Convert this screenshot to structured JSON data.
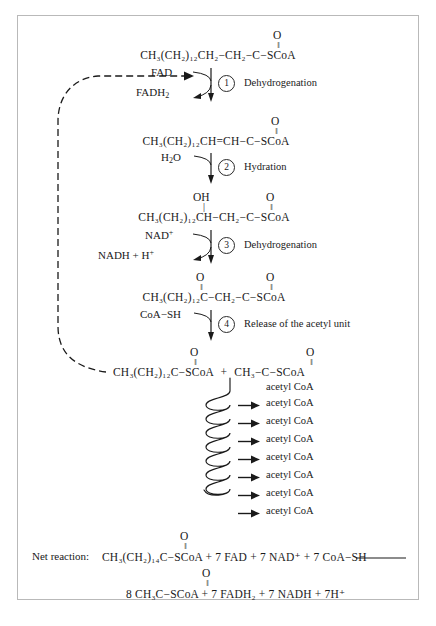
{
  "figure": {
    "ink_color": "#1a1a1a",
    "frame_color": "#b9b9b9",
    "background": "#ffffff"
  },
  "substrates": {
    "s1": {
      "carbonyl": "O",
      "chain": "CH₃(CH₂)₁₂CH₂−CH₂−C−SCoA",
      "label": "acyl CoA"
    },
    "s2": {
      "carbonyl": "O",
      "chain": "CH₃(CH₂)₁₂CH=CH−C−SCoA",
      "label": "trans-enoyl CoA"
    },
    "s3": {
      "hydroxyl": "OH",
      "carbonyl": "O",
      "chain": "CH₃(CH₂)₁₂CH−CH₂−C−SCoA",
      "label": "3-hydroxyacyl CoA"
    },
    "s4": {
      "carbonyl_a": "O",
      "carbonyl_b": "O",
      "chain": "CH₃(CH₂)₁₂C−CH₂−C−SCoA",
      "label": "3-ketoacyl CoA"
    },
    "s5": {
      "carbonyl_a": "O",
      "carbonyl_b": "O",
      "chain_left": "CH₃(CH₂)₁₂C−SCoA",
      "plus": "+",
      "chain_right": "CH₃−C−SCoA",
      "label": "shortened acyl CoA plus acetyl CoA"
    }
  },
  "steps": [
    {
      "number": "1",
      "name": "Dehydrogenation",
      "reactant": "FAD",
      "product": "FADH",
      "product_sub": "2"
    },
    {
      "number": "2",
      "name": "Hydration",
      "reactant": "H",
      "reactant_sub": "2",
      "reactant_tail": "O",
      "product": ""
    },
    {
      "number": "3",
      "name": "Dehydrogenation",
      "reactant": "NAD",
      "reactant_sup": "+",
      "product": "NADH  +  H",
      "product_sup": "+"
    },
    {
      "number": "4",
      "name": "Release of the acetyl unit",
      "reactant": "CoA−SH",
      "product": ""
    }
  ],
  "spiral": {
    "note": "coil of repeated beta-oxidation cycles",
    "loop_count": 7,
    "outputs": [
      "acetyl CoA",
      "acetyl CoA",
      "acetyl CoA",
      "acetyl CoA",
      "acetyl CoA",
      "acetyl CoA",
      "acetyl CoA",
      "acetyl CoA"
    ]
  },
  "net_reaction": {
    "label": "Net reaction:",
    "carbonyl_left": "O",
    "reactants": "CH₃(CH₂)₁₄C−SCoA  +  7 FAD  +  7 NAD⁺  +  7 CoA−SH",
    "arrow": "⟶",
    "carbonyl_right": "O",
    "products": "8 CH₃C−SCoA  +  7 FADH₂  +  7 NADH  +  7H⁺"
  },
  "recycle_arrow": {
    "name": "recycling-dashed-arrow",
    "description": "dashed feedback loop from shortened acyl CoA back to top acyl CoA"
  }
}
